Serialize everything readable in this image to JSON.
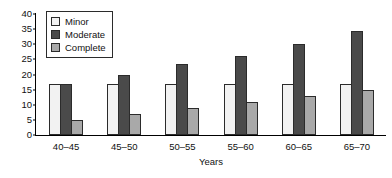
{
  "chart_data": {
    "type": "bar",
    "title": "",
    "xlabel": "Years",
    "ylabel": "",
    "categories": [
      "40–45",
      "45–50",
      "50–55",
      "55–60",
      "60–65",
      "65–70"
    ],
    "series": [
      {
        "name": "Minor",
        "color": "#f2f2f2",
        "values": [
          17,
          17,
          17,
          17,
          17,
          17
        ]
      },
      {
        "name": "Moderate",
        "color": "#4a4a4a",
        "values": [
          17,
          20,
          23.5,
          26,
          30,
          34.5
        ]
      },
      {
        "name": "Complete",
        "color": "#a9a9a9",
        "values": [
          5,
          7,
          9,
          11,
          13,
          15
        ]
      }
    ],
    "ylim": [
      0,
      40
    ],
    "yticks": [
      0,
      5,
      10,
      15,
      20,
      25,
      30,
      35,
      40
    ],
    "ytick_labels": [
      "0",
      "5",
      "10",
      "15",
      "20",
      "25",
      "30",
      "35",
      "40"
    ],
    "grid": false,
    "legend_position": "top-left",
    "bar_edge_color": "#2b2b2b",
    "axis_color": "#000000"
  },
  "legend": {
    "items": [
      {
        "label": "Minor"
      },
      {
        "label": "Moderate"
      },
      {
        "label": "Complete"
      }
    ]
  }
}
